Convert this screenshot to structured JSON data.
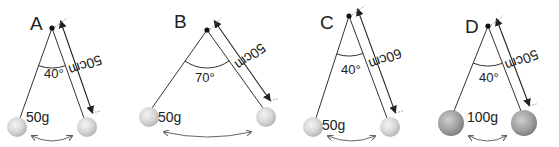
{
  "diagram": {
    "colors": {
      "line": "#333333",
      "ball_light": "#d9d9d9",
      "ball_dark": "#9a9a9a",
      "arc": "#555555"
    },
    "pendulums": [
      {
        "label": "A",
        "angle": "40°",
        "length": "50cm",
        "mass": "50g",
        "pivot": [
          52,
          28
        ],
        "left_ball": [
          17,
          127
        ],
        "right_ball": [
          87,
          127
        ],
        "ball_r": 10,
        "heavy": false,
        "label_pos": [
          30,
          30
        ],
        "angle_pos": [
          44,
          78
        ],
        "mass_pos": [
          26,
          122
        ],
        "angle_arc_r": 40
      },
      {
        "label": "B",
        "angle": "70°",
        "length": "50cm",
        "mass": "50g",
        "pivot": [
          207,
          30
        ],
        "left_ball": [
          149,
          117
        ],
        "right_ball": [
          266,
          117
        ],
        "ball_r": 10,
        "heavy": false,
        "label_pos": [
          174,
          28
        ],
        "angle_pos": [
          195,
          82
        ],
        "mass_pos": [
          158,
          122
        ],
        "angle_arc_r": 38
      },
      {
        "label": "C",
        "angle": "40°",
        "length": "60cm",
        "mass": "50g",
        "pivot": [
          349,
          16
        ],
        "left_ball": [
          313,
          127
        ],
        "right_ball": [
          390,
          127
        ],
        "ball_r": 10,
        "heavy": false,
        "label_pos": [
          320,
          29
        ],
        "angle_pos": [
          341,
          74
        ],
        "mass_pos": [
          322,
          130
        ],
        "angle_arc_r": 40
      },
      {
        "label": "D",
        "angle": "40°",
        "length": "50cm",
        "mass": "100g",
        "pivot": [
          488,
          26
        ],
        "left_ball": [
          451,
          123
        ],
        "right_ball": [
          524,
          123
        ],
        "ball_r": 13,
        "heavy": true,
        "label_pos": [
          465,
          33
        ],
        "angle_pos": [
          479,
          82
        ],
        "mass_pos": [
          467,
          122
        ],
        "angle_arc_r": 40
      }
    ]
  }
}
